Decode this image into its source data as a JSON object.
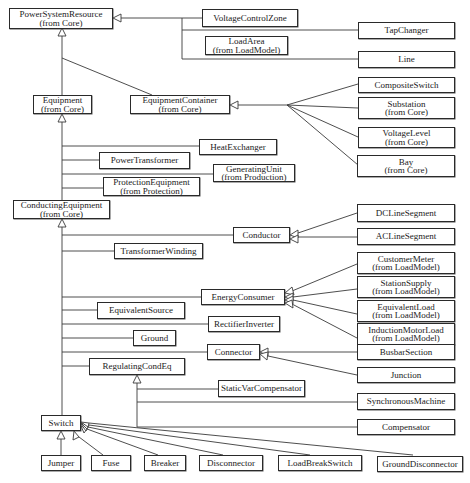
{
  "diagram": {
    "type": "uml-class-inheritance",
    "classes": {
      "power_system_resource": {
        "name": "PowerSystemResource",
        "package": "(from Core)"
      },
      "voltage_control_zone": {
        "name": "VoltageControlZone"
      },
      "tap_changer": {
        "name": "TapChanger"
      },
      "load_area": {
        "name": "LoadArea",
        "package": "(from LoadModel)"
      },
      "line": {
        "name": "Line"
      },
      "composite_switch": {
        "name": "CompositeSwitch"
      },
      "equipment": {
        "name": "Equipment",
        "package": "(from Core)"
      },
      "equipment_container": {
        "name": "EquipmentContainer",
        "package": "(from Core)"
      },
      "substation": {
        "name": "Substation",
        "package": "(from Core)"
      },
      "voltage_level": {
        "name": "VoltageLevel",
        "package": "(from Core)"
      },
      "bay": {
        "name": "Bay",
        "package": "(from Core)"
      },
      "heat_exchanger": {
        "name": "HeatExchanger"
      },
      "power_transformer": {
        "name": "PowerTransformer"
      },
      "generating_unit": {
        "name": "GeneratingUnit",
        "package": "(from Production)"
      },
      "protection_equipment": {
        "name": "ProtectionEquipment",
        "package": "(from Protection)"
      },
      "conducting_equipment": {
        "name": "ConductingEquipment",
        "package": "(from Core)"
      },
      "conductor": {
        "name": "Conductor"
      },
      "dc_line_segment": {
        "name": "DCLineSegment"
      },
      "ac_line_segment": {
        "name": "ACLineSegment"
      },
      "transformer_winding": {
        "name": "TransformerWinding"
      },
      "customer_meter": {
        "name": "CustomerMeter",
        "package": "(from LoadModel)"
      },
      "station_supply": {
        "name": "StationSupply",
        "package": "(from LoadModel)"
      },
      "energy_consumer": {
        "name": "EnergyConsumer"
      },
      "equivalent_load": {
        "name": "EquivalentLoad",
        "package": "(from LoadModel)"
      },
      "equivalent_source": {
        "name": "EquivalentSource"
      },
      "rectifier_inverter": {
        "name": "RectifierInverter"
      },
      "induction_motor_load": {
        "name": "InductionMotorLoad",
        "package": "(from LoadModel)"
      },
      "ground": {
        "name": "Ground"
      },
      "connector": {
        "name": "Connector"
      },
      "busbar_section": {
        "name": "BusbarSection"
      },
      "regulating_cond_eq": {
        "name": "RegulatingCondEq"
      },
      "junction": {
        "name": "Junction"
      },
      "static_var_compensator": {
        "name": "StaticVarCompensator"
      },
      "synchronous_machine": {
        "name": "SynchronousMachine"
      },
      "compensator": {
        "name": "Compensator"
      },
      "switch": {
        "name": "Switch"
      },
      "jumper": {
        "name": "Jumper"
      },
      "fuse": {
        "name": "Fuse"
      },
      "breaker": {
        "name": "Breaker"
      },
      "disconnector": {
        "name": "Disconnector"
      },
      "load_break_switch": {
        "name": "LoadBreakSwitch"
      },
      "ground_disconnector": {
        "name": "GroundDisconnector"
      }
    },
    "generalizations": [
      {
        "parent": "PowerSystemResource",
        "children": [
          "VoltageControlZone",
          "TapChanger",
          "LoadArea",
          "Line",
          "Equipment",
          "EquipmentContainer"
        ]
      },
      {
        "parent": "EquipmentContainer",
        "children": [
          "CompositeSwitch",
          "Substation",
          "VoltageLevel",
          "Bay"
        ]
      },
      {
        "parent": "Equipment",
        "children": [
          "HeatExchanger",
          "PowerTransformer",
          "GeneratingUnit",
          "ProtectionEquipment",
          "ConductingEquipment"
        ]
      },
      {
        "parent": "ConductingEquipment",
        "children": [
          "Conductor",
          "TransformerWinding",
          "EnergyConsumer",
          "EquivalentSource",
          "RectifierInverter",
          "Ground",
          "Connector",
          "RegulatingCondEq",
          "Switch"
        ]
      },
      {
        "parent": "Conductor",
        "children": [
          "DCLineSegment",
          "ACLineSegment"
        ]
      },
      {
        "parent": "EnergyConsumer",
        "children": [
          "CustomerMeter",
          "StationSupply",
          "EquivalentLoad",
          "InductionMotorLoad"
        ]
      },
      {
        "parent": "Connector",
        "children": [
          "BusbarSection",
          "Junction"
        ]
      },
      {
        "parent": "RegulatingCondEq",
        "children": [
          "StaticVarCompensator",
          "SynchronousMachine",
          "Compensator"
        ]
      },
      {
        "parent": "Switch",
        "children": [
          "Jumper",
          "Fuse",
          "Breaker",
          "Disconnector",
          "LoadBreakSwitch",
          "GroundDisconnector"
        ]
      }
    ],
    "colors": {
      "line": "#3a3a3a",
      "box_border": "#2a2a2a",
      "background": "#ffffff"
    }
  }
}
